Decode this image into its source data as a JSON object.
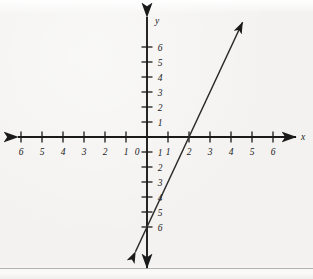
{
  "figure": {
    "kind": "coordinate-plane-line-graph",
    "background_color": "#f3f2f0",
    "ink_color": "#1a1a1a"
  },
  "axes": {
    "x_axis_name": "x",
    "y_axis_name": "y",
    "origin_label": "0",
    "x_tick_labels_negative": [
      "6",
      "5",
      "4",
      "3",
      "2",
      "1"
    ],
    "x_tick_labels_positive": [
      "1",
      "2",
      "3",
      "4",
      "5",
      "6"
    ],
    "y_tick_labels_positive": [
      "1",
      "2",
      "3",
      "4",
      "5",
      "6"
    ],
    "y_tick_labels_negative": [
      "1",
      "2",
      "3",
      "4",
      "5",
      "6"
    ]
  },
  "chart_data": {
    "type": "line",
    "title": "",
    "subtitle": "",
    "xlabel": "x",
    "ylabel": "y",
    "xlim": [
      -7,
      7
    ],
    "ylim": [
      -7.5,
      7.5
    ],
    "xticks": [
      -6,
      -5,
      -4,
      -3,
      -2,
      -1,
      0,
      1,
      2,
      3,
      4,
      5,
      6
    ],
    "yticks": [
      -6,
      -5,
      -4,
      -3,
      -2,
      -1,
      1,
      2,
      3,
      4,
      5,
      6
    ],
    "xtick_labels": [
      "6",
      "5",
      "4",
      "3",
      "2",
      "1",
      "0",
      "1",
      "2",
      "3",
      "4",
      "5",
      "6"
    ],
    "ytick_labels": [
      "6",
      "5",
      "4",
      "3",
      "2",
      "1",
      "1",
      "2",
      "3",
      "4",
      "5",
      "6"
    ],
    "grid": false,
    "legend": false,
    "legend_position": "none",
    "annotations": [],
    "series": [
      {
        "name": "line",
        "equation": "y = 3x - 6",
        "slope": 3,
        "y_intercept": -6,
        "x_intercept": 2,
        "arrowheads": "both",
        "x": [
          -0.55,
          2,
          4.55
        ],
        "y": [
          -7.65,
          0,
          7.65
        ],
        "points_of_interest": [
          {
            "label": "x-intercept",
            "x": 2,
            "y": 0
          },
          {
            "label": "y-intercept",
            "x": 0,
            "y": -6
          }
        ]
      }
    ]
  }
}
